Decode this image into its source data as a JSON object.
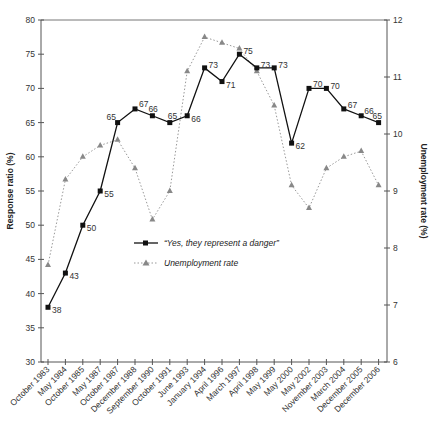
{
  "chart_data": {
    "type": "line",
    "title": "",
    "xlabel": "",
    "ylabel": "Response ratio (%)",
    "y2label": "Unemployment rate (%)",
    "ylim": [
      30,
      80
    ],
    "y2lim": [
      6,
      12
    ],
    "yticks": [
      30,
      35,
      40,
      45,
      50,
      55,
      60,
      65,
      70,
      75,
      80
    ],
    "y2ticks": [
      6,
      7,
      8,
      9,
      10,
      11,
      12
    ],
    "grid": false,
    "legend_position": "inside-center-left",
    "categories": [
      "October 1983",
      "May 1984",
      "October 1985",
      "May 1987",
      "October 1987",
      "December 1988",
      "September 1990",
      "October 1991",
      "June 1993",
      "January 1994",
      "April 1996",
      "March 1997",
      "April 1998",
      "May 1999",
      "May 2000",
      "May 2002",
      "November 2003",
      "March 2004",
      "December 2005",
      "December 2006"
    ],
    "series": [
      {
        "name": "“Yes, they represent a danger”",
        "axis": "left",
        "style": "solid-square",
        "color": "#111111",
        "values": [
          38,
          43,
          50,
          55,
          65,
          67,
          66,
          65,
          66,
          73,
          71,
          75,
          73,
          73,
          62,
          70,
          70,
          67,
          66,
          65
        ],
        "labels_shown": true
      },
      {
        "name": "Unemployment rate",
        "axis": "right",
        "style": "dotted-triangle",
        "color": "#888888",
        "values": [
          7.7,
          9.2,
          9.6,
          9.8,
          9.9,
          9.4,
          8.5,
          9.0,
          11.1,
          11.7,
          11.6,
          11.5,
          11.1,
          10.5,
          9.1,
          8.7,
          9.4,
          9.6,
          9.7,
          9.1
        ],
        "labels_shown": false
      }
    ]
  }
}
